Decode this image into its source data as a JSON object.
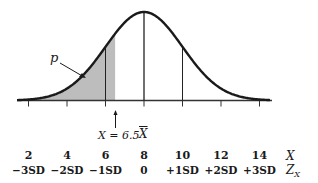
{
  "figure": {
    "p_label": "p",
    "marker_label": "X = 6.5",
    "mean_label": "X",
    "x_axis_name": "X",
    "z_axis_name": "Z",
    "z_axis_sub": "X",
    "x_values": [
      "2",
      "4",
      "6",
      "8",
      "10",
      "12",
      "14"
    ],
    "z_values": [
      "−3SD",
      "−2SD",
      "−1SD",
      "0",
      "+1SD",
      "+2SD",
      "+3SD"
    ],
    "colors": {
      "curve": "#1a1a1a",
      "shade": "#bdbdbd",
      "axis": "#333333"
    }
  },
  "chart_data": {
    "type": "area",
    "title": "",
    "mean": 8,
    "sd": 2,
    "shade_upper": 6.5,
    "x_ticks": [
      2,
      4,
      6,
      8,
      10,
      12,
      14
    ],
    "z_ticks": [
      "-3SD",
      "-2SD",
      "-1SD",
      "0",
      "+1SD",
      "+2SD",
      "+3SD"
    ],
    "xlabel": "X",
    "zlabel": "Z_X",
    "vertical_lines_at": [
      6,
      8,
      10
    ],
    "annotations": [
      "p",
      "X = 6.5",
      "X̄"
    ]
  }
}
